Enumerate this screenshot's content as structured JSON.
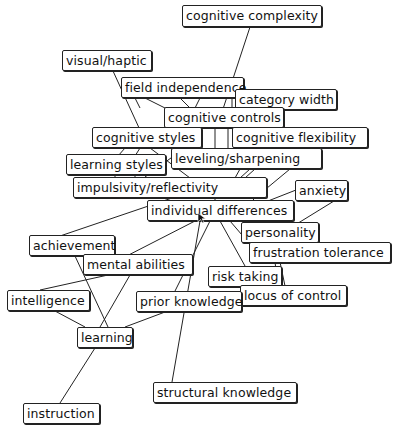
{
  "header_fragment": "                                      ",
  "nodes": [
    {
      "id": "cognitive-complexity",
      "label": "cognitive complexity",
      "x": 182,
      "y": 5,
      "w": 140,
      "h": 22
    },
    {
      "id": "visual-haptic",
      "label": "visual/haptic",
      "x": 62,
      "y": 50,
      "w": 90,
      "h": 21
    },
    {
      "id": "field-independence",
      "label": "field independence",
      "x": 121,
      "y": 77,
      "w": 123,
      "h": 21
    },
    {
      "id": "category-width",
      "label": "category width",
      "x": 235,
      "y": 89,
      "w": 102,
      "h": 21
    },
    {
      "id": "cognitive-controls",
      "label": "cognitive controls",
      "x": 164,
      "y": 107,
      "w": 120,
      "h": 21
    },
    {
      "id": "cognitive-styles",
      "label": "cognitive styles",
      "x": 92,
      "y": 127,
      "w": 110,
      "h": 21
    },
    {
      "id": "cognitive-flexibility",
      "label": "cognitive flexibility",
      "x": 232,
      "y": 127,
      "w": 136,
      "h": 21
    },
    {
      "id": "learning-styles",
      "label": "learning styles",
      "x": 66,
      "y": 154,
      "w": 100,
      "h": 21
    },
    {
      "id": "leveling-sharpening",
      "label": "leveling/sharpening",
      "x": 171,
      "y": 148,
      "w": 151,
      "h": 21
    },
    {
      "id": "impulsivity-reflectivity",
      "label": "impulsivity/reflectivity",
      "x": 73,
      "y": 177,
      "w": 194,
      "h": 21
    },
    {
      "id": "anxiety",
      "label": "anxiety",
      "x": 295,
      "y": 180,
      "w": 53,
      "h": 21
    },
    {
      "id": "individual-differences",
      "label": "individual differences",
      "x": 147,
      "y": 200,
      "w": 147,
      "h": 21
    },
    {
      "id": "personality",
      "label": "personality",
      "x": 241,
      "y": 222,
      "w": 78,
      "h": 21
    },
    {
      "id": "frustration-tolerance",
      "label": "frustration tolerance",
      "x": 249,
      "y": 242,
      "w": 142,
      "h": 21
    },
    {
      "id": "achievement",
      "label": "achievement",
      "x": 29,
      "y": 235,
      "w": 86,
      "h": 21
    },
    {
      "id": "mental-abilities",
      "label": "mental abilities",
      "x": 83,
      "y": 254,
      "w": 110,
      "h": 21
    },
    {
      "id": "risk-taking",
      "label": "risk taking",
      "x": 208,
      "y": 266,
      "w": 74,
      "h": 21
    },
    {
      "id": "locus-of-control",
      "label": "locus of control",
      "x": 240,
      "y": 285,
      "w": 107,
      "h": 21
    },
    {
      "id": "intelligence",
      "label": "intelligence",
      "x": 7,
      "y": 290,
      "w": 83,
      "h": 21
    },
    {
      "id": "prior-knowledge",
      "label": "prior knowledge",
      "x": 136,
      "y": 291,
      "w": 106,
      "h": 21
    },
    {
      "id": "learning",
      "label": "learning",
      "x": 77,
      "y": 327,
      "w": 56,
      "h": 21
    },
    {
      "id": "structural-knowledge",
      "label": "structural knowledge",
      "x": 153,
      "y": 382,
      "w": 144,
      "h": 21
    },
    {
      "id": "instruction",
      "label": "instruction",
      "x": 23,
      "y": 403,
      "w": 77,
      "h": 21
    }
  ],
  "edges": [
    [
      250,
      27,
      222,
      112
    ],
    [
      113,
      71,
      140,
      130
    ],
    [
      135,
      98,
      140,
      108
    ],
    [
      145,
      98,
      165,
      108
    ],
    [
      180,
      98,
      190,
      108
    ],
    [
      200,
      98,
      195,
      108
    ],
    [
      232,
      98,
      232,
      108
    ],
    [
      246,
      110,
      240,
      108
    ],
    [
      200,
      128,
      185,
      148
    ],
    [
      215,
      128,
      215,
      148
    ],
    [
      228,
      128,
      228,
      148
    ],
    [
      125,
      148,
      118,
      156
    ],
    [
      140,
      148,
      135,
      156
    ],
    [
      150,
      148,
      190,
      178
    ],
    [
      175,
      155,
      145,
      177
    ],
    [
      115,
      175,
      115,
      178
    ],
    [
      135,
      175,
      135,
      178
    ],
    [
      240,
      169,
      235,
      178
    ],
    [
      250,
      169,
      240,
      178
    ],
    [
      255,
      169,
      245,
      178
    ],
    [
      290,
      169,
      255,
      198
    ],
    [
      215,
      198,
      215,
      201
    ],
    [
      252,
      198,
      255,
      201
    ],
    [
      296,
      190,
      268,
      201
    ],
    [
      334,
      201,
      295,
      225
    ],
    [
      290,
      221,
      292,
      223
    ],
    [
      230,
      221,
      248,
      242
    ],
    [
      220,
      221,
      245,
      266
    ],
    [
      210,
      221,
      175,
      291
    ],
    [
      200,
      221,
      172,
      382
    ],
    [
      195,
      221,
      113,
      263
    ],
    [
      172,
      198,
      60,
      236
    ],
    [
      280,
      262,
      285,
      286
    ],
    [
      275,
      262,
      278,
      286
    ],
    [
      75,
      256,
      108,
      327
    ],
    [
      130,
      275,
      100,
      327
    ],
    [
      108,
      275,
      40,
      290
    ],
    [
      55,
      311,
      85,
      327
    ],
    [
      165,
      312,
      125,
      327
    ],
    [
      95,
      348,
      60,
      403
    ]
  ],
  "cursor": {
    "x": 197,
    "y": 212
  }
}
